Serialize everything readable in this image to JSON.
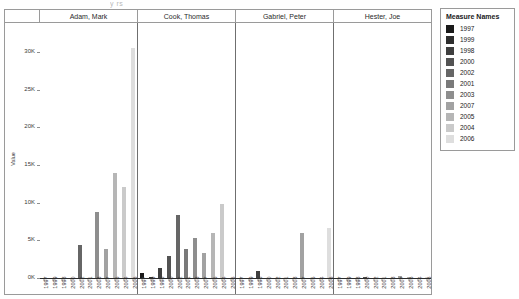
{
  "title_fragment": "y            rs",
  "chart_data": {
    "type": "bar",
    "title": "",
    "xlabel": "",
    "ylabel": "Value",
    "ylim": [
      0,
      32000
    ],
    "yticks": [
      0,
      5000,
      10000,
      15000,
      20000,
      25000,
      30000
    ],
    "ytick_labels": [
      "0K",
      "5K",
      "10K",
      "15K",
      "20K",
      "25K",
      "30K"
    ],
    "grid": false,
    "legend_position": "right",
    "legend_title": "Measure Names",
    "panel_label_field": "Salesperson",
    "categories": [
      "1997",
      "1999",
      "1998",
      "2000",
      "2002",
      "2001",
      "2003",
      "2007",
      "2005",
      "2004",
      "2006"
    ],
    "colors": [
      "#1a1a1a",
      "#2e2e2e",
      "#3f3f3f",
      "#535353",
      "#666666",
      "#7a7a7a",
      "#8e8e8e",
      "#a2a2a2",
      "#b6b6b6",
      "#cacaca",
      "#dedede"
    ],
    "panels": [
      {
        "name": "Adam, Mark",
        "values": [
          0,
          0,
          0,
          0,
          4350,
          0,
          8750,
          3800,
          14000,
          12100,
          30600
        ]
      },
      {
        "name": "Cook, Thomas",
        "values": [
          600,
          150,
          1300,
          2900,
          8400,
          3800,
          5300,
          3300,
          6000,
          9850,
          0
        ]
      },
      {
        "name": "Gabriel, Peter",
        "values": [
          0,
          0,
          900,
          0,
          0,
          0,
          0,
          6000,
          0,
          0,
          6650
        ]
      },
      {
        "name": "Hester, Joe",
        "values": [
          0,
          0,
          0,
          120,
          0,
          0,
          0,
          250,
          180,
          0,
          90
        ]
      }
    ],
    "legend_entries": [
      {
        "label": "1997",
        "color": "#1a1a1a"
      },
      {
        "label": "1999",
        "color": "#2e2e2e"
      },
      {
        "label": "1998",
        "color": "#3f3f3f"
      },
      {
        "label": "2000",
        "color": "#535353"
      },
      {
        "label": "2002",
        "color": "#666666"
      },
      {
        "label": "2001",
        "color": "#7a7a7a"
      },
      {
        "label": "2003",
        "color": "#8e8e8e"
      },
      {
        "label": "2007",
        "color": "#a2a2a2"
      },
      {
        "label": "2005",
        "color": "#b6b6b6"
      },
      {
        "label": "2004",
        "color": "#cacaca"
      },
      {
        "label": "2006",
        "color": "#dedede"
      }
    ]
  }
}
